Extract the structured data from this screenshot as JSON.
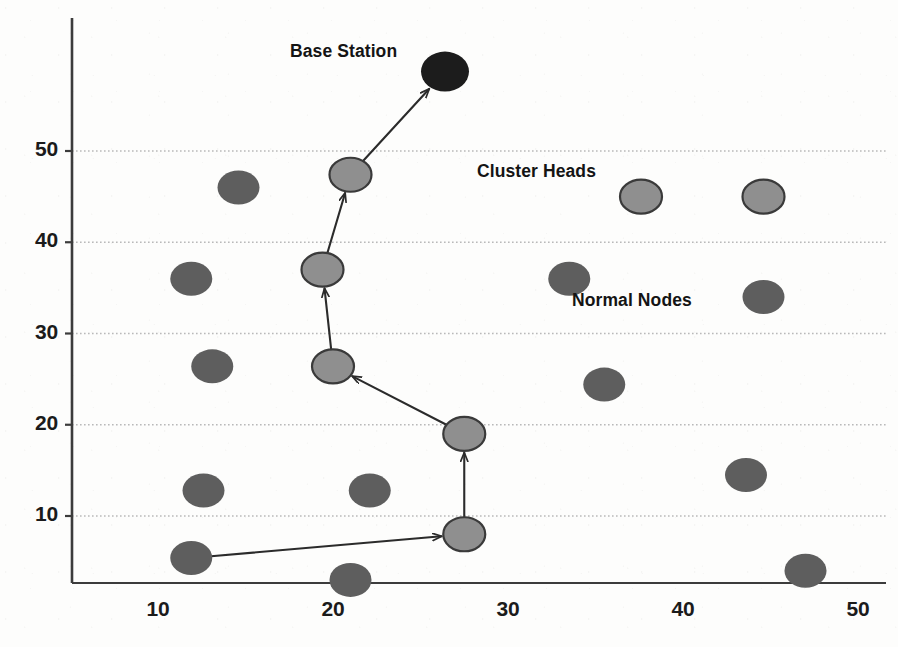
{
  "figure": {
    "kind": "wireless-sensor-network-topology-scatter",
    "background_color": "#fdfdfc"
  },
  "annotations": [
    {
      "name": "base-station-label",
      "text": "Base Station",
      "x_px": 290,
      "y_px": 41
    },
    {
      "name": "cluster-heads-label",
      "text": "Cluster Heads",
      "x_px": 477,
      "y_px": 161
    },
    {
      "name": "normal-nodes-label",
      "text": "Normal Nodes",
      "x_px": 572,
      "y_px": 290
    }
  ],
  "axes": {
    "x_ticks": [
      10,
      20,
      30,
      40,
      50
    ],
    "y_ticks": [
      10,
      20,
      30,
      40,
      50
    ],
    "x_tick_labels": [
      "10",
      "20",
      "30",
      "40",
      "50"
    ],
    "y_tick_labels": [
      "10",
      "20",
      "30",
      "40",
      "50"
    ],
    "x_range": [
      5.1,
      52.3
    ],
    "y_range": [
      1.2,
      63.0
    ],
    "gridlines": "horizontal-dotted",
    "grid_color": "#b9b9b9",
    "axis_color": "#3c3c3c"
  },
  "legend": {
    "base_station_color": "#1c1c1c",
    "cluster_head_color": "#8f8f8f",
    "cluster_head_stroke": "#3a3a3a",
    "normal_node_color": "#5e5e5e",
    "link_color": "#2b2b2b"
  },
  "chart_data": {
    "type": "scatter",
    "title": "",
    "xlabel": "",
    "ylabel": "",
    "xlim": [
      5.1,
      52.3
    ],
    "ylim": [
      1.2,
      63.0
    ],
    "grid": true,
    "legend_position": "inline-annotations",
    "series": [
      {
        "name": "Base Station",
        "marker": "filled-ellipse",
        "color": "#1c1c1c",
        "rx": 24,
        "ry": 20,
        "points": [
          {
            "x": 26.4,
            "y": 58.7
          }
        ]
      },
      {
        "name": "Cluster Heads",
        "marker": "outlined-ellipse",
        "color": "#8f8f8f",
        "stroke": "#3a3a3a",
        "rx": 21,
        "ry": 17,
        "points": [
          {
            "x": 21.0,
            "y": 47.4
          },
          {
            "x": 19.4,
            "y": 37.0
          },
          {
            "x": 20.0,
            "y": 26.4
          },
          {
            "x": 27.5,
            "y": 19.0
          },
          {
            "x": 27.5,
            "y": 8.0
          },
          {
            "x": 37.6,
            "y": 45.0
          },
          {
            "x": 44.6,
            "y": 45.0
          }
        ]
      },
      {
        "name": "Normal Nodes",
        "marker": "filled-ellipse",
        "color": "#5e5e5e",
        "rx": 21,
        "ry": 17,
        "points": [
          {
            "x": 14.6,
            "y": 46.0
          },
          {
            "x": 11.9,
            "y": 36.0
          },
          {
            "x": 13.1,
            "y": 26.4
          },
          {
            "x": 12.6,
            "y": 12.8
          },
          {
            "x": 22.1,
            "y": 12.8
          },
          {
            "x": 11.9,
            "y": 5.4
          },
          {
            "x": 21.0,
            "y": 3.0
          },
          {
            "x": 33.5,
            "y": 36.0
          },
          {
            "x": 44.6,
            "y": 34.0
          },
          {
            "x": 35.5,
            "y": 24.4
          },
          {
            "x": 43.6,
            "y": 14.5
          },
          {
            "x": 47.0,
            "y": 4.0
          }
        ]
      }
    ],
    "links": [
      {
        "name": "ch-to-base-station",
        "from": {
          "x": 21.0,
          "y": 47.4
        },
        "to": {
          "x": 26.4,
          "y": 58.7
        },
        "arrow": true
      },
      {
        "name": "ch37-to-ch47",
        "from": {
          "x": 19.4,
          "y": 37.0
        },
        "to": {
          "x": 21.0,
          "y": 47.4
        },
        "arrow": true
      },
      {
        "name": "ch26-to-ch37",
        "from": {
          "x": 20.0,
          "y": 26.4
        },
        "to": {
          "x": 19.4,
          "y": 37.0
        },
        "arrow": true
      },
      {
        "name": "ch19-to-ch26",
        "from": {
          "x": 27.5,
          "y": 19.0
        },
        "to": {
          "x": 20.0,
          "y": 26.4
        },
        "arrow": true
      },
      {
        "name": "ch8-to-ch19",
        "from": {
          "x": 27.5,
          "y": 8.0
        },
        "to": {
          "x": 27.5,
          "y": 19.0
        },
        "arrow": true
      },
      {
        "name": "node-to-ch8",
        "from": {
          "x": 11.9,
          "y": 5.4
        },
        "to": {
          "x": 27.5,
          "y": 8.0
        },
        "arrow": true
      }
    ]
  }
}
